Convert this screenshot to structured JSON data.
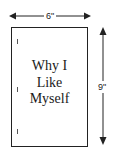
{
  "book": {
    "title_lines": [
      "Why I",
      "Like",
      "Myself"
    ],
    "binding_marks": 3
  },
  "dimensions": {
    "width_label": "6\"",
    "height_label": "9\""
  },
  "colors": {
    "stroke": "#222222",
    "text": "#1a1a1a",
    "background": "#ffffff"
  }
}
